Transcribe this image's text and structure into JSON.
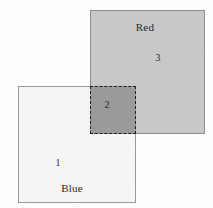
{
  "figure": {
    "type": "set-diagram",
    "background_color": "#fefefe",
    "width": 213,
    "height": 208
  },
  "sets": [
    {
      "id": "red",
      "name": "Red",
      "name_label": "Red",
      "name_x": 145,
      "name_y": 27,
      "region_number": "3",
      "number_x": 158,
      "number_y": 58,
      "x": 90,
      "y": 10,
      "width": 115,
      "height": 124,
      "fill_color": "#c8c8c8",
      "border_color": "#8d8d8d",
      "border_style": "solid",
      "border_width": 1
    },
    {
      "id": "blue",
      "name": "Blue",
      "name_label": "Blue",
      "name_x": 72,
      "name_y": 188,
      "region_number": "1",
      "number_x": 58,
      "number_y": 163,
      "x": 18,
      "y": 86,
      "width": 118,
      "height": 117,
      "fill_color": "#f5f5f3",
      "border_color": "#9a9a9a",
      "border_style": "solid",
      "border_width": 1
    }
  ],
  "intersection": {
    "id": "overlap",
    "region_number": "2",
    "number_x": 107,
    "number_y": 105,
    "x": 90,
    "y": 86,
    "width": 46,
    "height": 48,
    "fill_color": "#9a9a9a",
    "border_color": "#1e1e1e",
    "border_style": "dashed",
    "border_width": 1
  }
}
